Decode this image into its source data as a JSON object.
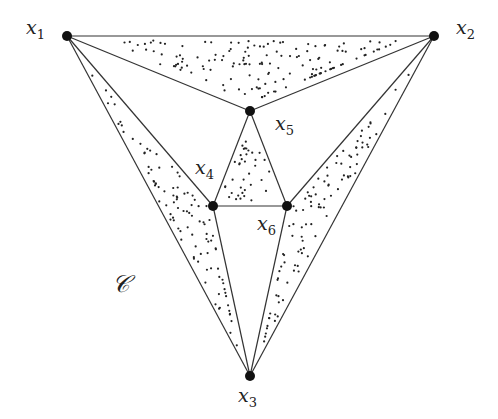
{
  "vertices": [
    {
      "id": "x1",
      "label": "x",
      "sub": "1",
      "x": 67,
      "y": 36,
      "lx": 26,
      "ly": 16
    },
    {
      "id": "x2",
      "label": "x",
      "sub": "2",
      "x": 434,
      "y": 36,
      "lx": 456,
      "ly": 16
    },
    {
      "id": "x3",
      "label": "x",
      "sub": "3",
      "x": 250,
      "y": 376,
      "lx": 238,
      "ly": 384
    },
    {
      "id": "x4",
      "label": "x",
      "sub": "4",
      "x": 213,
      "y": 206,
      "lx": 195,
      "ly": 156
    },
    {
      "id": "x5",
      "label": "x",
      "sub": "5",
      "x": 250,
      "y": 111,
      "lx": 275,
      "ly": 112
    },
    {
      "id": "x6",
      "label": "x",
      "sub": "6",
      "x": 287,
      "y": 206,
      "lx": 257,
      "ly": 212
    }
  ],
  "edges": [
    [
      "x1",
      "x2"
    ],
    [
      "x1",
      "x3"
    ],
    [
      "x2",
      "x3"
    ],
    [
      "x1",
      "x5"
    ],
    [
      "x2",
      "x5"
    ],
    [
      "x1",
      "x4"
    ],
    [
      "x2",
      "x6"
    ],
    [
      "x4",
      "x5"
    ],
    [
      "x5",
      "x6"
    ],
    [
      "x4",
      "x6"
    ],
    [
      "x4",
      "x3"
    ],
    [
      "x6",
      "x3"
    ]
  ],
  "shaded_faces": [
    [
      "x1",
      "x2",
      "x5"
    ],
    [
      "x4",
      "x5",
      "x6"
    ],
    [
      "x1",
      "x4",
      "x3"
    ],
    [
      "x2",
      "x6",
      "x3"
    ]
  ],
  "region_label": {
    "text": "𝒞",
    "x": 112,
    "y": 270
  },
  "colors": {
    "line": "#333333",
    "vertex": "#111111",
    "dots": "#222222"
  }
}
